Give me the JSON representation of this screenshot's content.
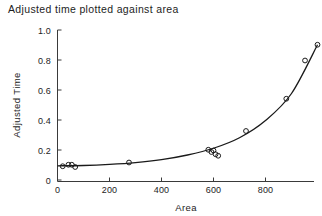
{
  "chart_data": {
    "type": "scatter",
    "title": "Adjusted time plotted against area",
    "xlabel": "Area",
    "ylabel": "Adjusted Time",
    "xlim": [
      0,
      1000
    ],
    "ylim": [
      0,
      1.0
    ],
    "xticks": [
      0,
      200,
      400,
      600,
      800
    ],
    "xticklabels": [
      "0",
      "200",
      "400",
      "600",
      "800"
    ],
    "yticks": [
      0,
      0.2,
      0.4,
      0.6,
      0.8,
      1.0
    ],
    "yticklabels": [
      "0",
      "0.2",
      "0.4",
      "0.6",
      "0.8",
      "1.0"
    ],
    "grid": false,
    "legend": null,
    "marker": "open-circle",
    "points": [
      {
        "x": 20,
        "y": 0.095
      },
      {
        "x": 42,
        "y": 0.105
      },
      {
        "x": 55,
        "y": 0.105
      },
      {
        "x": 68,
        "y": 0.09
      },
      {
        "x": 275,
        "y": 0.12
      },
      {
        "x": 580,
        "y": 0.205
      },
      {
        "x": 592,
        "y": 0.19
      },
      {
        "x": 600,
        "y": 0.2
      },
      {
        "x": 608,
        "y": 0.175
      },
      {
        "x": 618,
        "y": 0.165
      },
      {
        "x": 725,
        "y": 0.33
      },
      {
        "x": 880,
        "y": 0.545
      },
      {
        "x": 952,
        "y": 0.8
      },
      {
        "x": 1000,
        "y": 0.905
      }
    ],
    "series": [
      {
        "name": "fitted curve",
        "type": "line",
        "x": [
          0,
          100,
          200,
          300,
          400,
          500,
          600,
          700,
          800,
          900,
          1000
        ],
        "y": [
          0.098,
          0.1,
          0.107,
          0.119,
          0.139,
          0.17,
          0.215,
          0.285,
          0.4,
          0.58,
          0.905
        ]
      }
    ]
  },
  "colors": {
    "axis": "#3a3a3a",
    "curve": "#1a1a1a",
    "marker": "#1a1a1a",
    "text": "#1d1d1d",
    "background": "#ffffff"
  }
}
